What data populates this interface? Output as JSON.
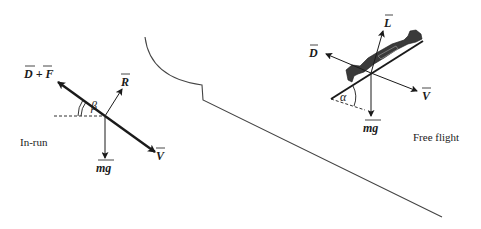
{
  "colors": {
    "ink": "#1a1a1a",
    "body": "#3a3a3a",
    "line": "#444444",
    "background": "#ffffff"
  },
  "inrun": {
    "caption": "In-run",
    "vectors": {
      "drag_plus_friction": "D + F",
      "reaction": "R",
      "gravity": "mg",
      "velocity": "V"
    },
    "angle": "β"
  },
  "free_flight": {
    "caption": "Free flight",
    "vectors": {
      "drag": "D",
      "lift": "L",
      "gravity": "mg",
      "velocity": "V"
    },
    "angle": "α"
  },
  "hill": {
    "description": "Ski jump profile: curved in-run ramp, take-off step, landing slope"
  }
}
